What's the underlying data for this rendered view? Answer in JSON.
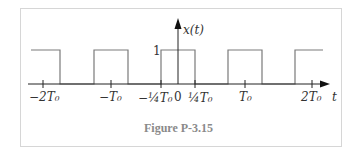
{
  "figure": {
    "caption": "Figure P-3.15",
    "signal_label": "x(t)",
    "amplitude_label": "1",
    "time_axis_label": "t",
    "origin_label": "0",
    "tick_labels": {
      "neg_2T0": "−2T₀",
      "neg_T0": "−T₀",
      "neg_quarter_T0": "−¼T₀",
      "quarter_T0": "¼T₀",
      "T0": "T₀",
      "pos_2T0": "2T₀"
    },
    "colors": {
      "waveform": "#7a7a7a",
      "axis": "#222222",
      "caption": "#8a8a8a",
      "frame": "#d6d6d6"
    }
  },
  "diagram_data": {
    "type": "periodic_rectangular_pulse_train",
    "period": "T0",
    "amplitude": 1,
    "pulse_interval_within_period": [
      "-T0/4",
      "T0/4"
    ],
    "duty_cycle": 0.5,
    "visible_time_range": [
      "-2.4T0",
      "2.2T0"
    ]
  }
}
